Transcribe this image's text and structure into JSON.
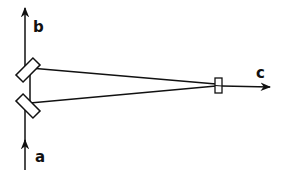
{
  "diagram": {
    "labels": {
      "a": "a",
      "b": "b",
      "c": "c"
    },
    "colors": {
      "stroke": "#111111",
      "background": "#ffffff"
    },
    "elements": [
      {
        "id": "beam-a",
        "label": "a",
        "description": "input beam, upward arrow from bottom"
      },
      {
        "id": "beam-b",
        "label": "b",
        "description": "output beam, upward arrow at top"
      },
      {
        "id": "beam-c",
        "label": "c",
        "description": "output beam, rightward arrow"
      },
      {
        "id": "mirror-upper",
        "description": "upper tilted mirror / beam splitter"
      },
      {
        "id": "mirror-lower",
        "description": "lower tilted mirror / beam splitter"
      },
      {
        "id": "lens",
        "description": "small rectangular element on right (lens / detector)"
      }
    ]
  }
}
